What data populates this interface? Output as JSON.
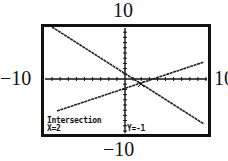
{
  "window_labels": {
    "ymax": "10",
    "ymin": "−10",
    "xmin": "−10",
    "xmax": "10"
  },
  "readout": {
    "title": "Intersection",
    "x": "X=2",
    "y": "Y=-1"
  },
  "colors": {
    "background": "#ffffff",
    "ink": "#111111"
  },
  "chart_data": {
    "type": "line",
    "title": "Intersection",
    "xlabel": "",
    "ylabel": "",
    "xlim": [
      -10,
      10
    ],
    "ylim": [
      -10,
      10
    ],
    "grid": false,
    "tick_spacing": 1,
    "series": [
      {
        "name": "decreasing line",
        "x": [
          -9,
          10
        ],
        "y": [
          8.5,
          -7.5
        ]
      },
      {
        "name": "increasing line",
        "x": [
          -8.5,
          10
        ],
        "y": [
          -5.5,
          3
        ]
      }
    ],
    "annotations": [
      {
        "text": "Intersection",
        "position": "bottom-left"
      },
      {
        "text": "X=2",
        "position": "bottom-left"
      },
      {
        "text": "Y=-1",
        "position": "bottom-center"
      }
    ],
    "intersection": {
      "x": 2,
      "y": -1
    }
  }
}
